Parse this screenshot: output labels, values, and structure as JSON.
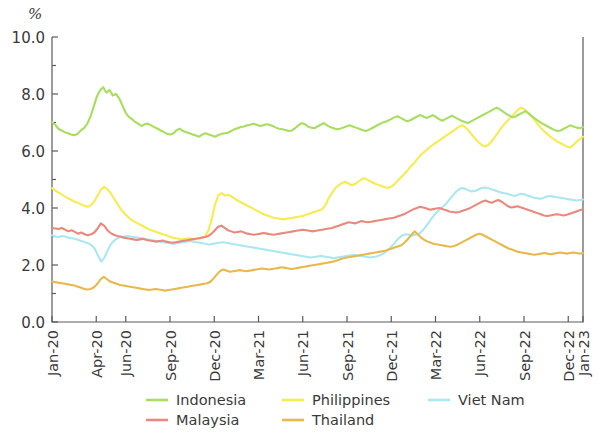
{
  "chart_data": {
    "type": "line",
    "title": "",
    "subtitle": "",
    "xlabel": "",
    "ylabel": "%",
    "unit_label": "%",
    "ylim": [
      0.0,
      10.0
    ],
    "ytick_labels": [
      "0.0",
      "2.0",
      "4.0",
      "6.0",
      "8.0",
      "10.0"
    ],
    "ytick_values": [
      0.0,
      2.0,
      4.0,
      6.0,
      8.0,
      10.0
    ],
    "yminor_values": [
      1.0,
      3.0,
      5.0,
      7.0,
      9.0
    ],
    "grid": false,
    "legend_position": "bottom",
    "x_tick_labels": [
      "Jan-20",
      "Apr-20",
      "Jun-20",
      "Sep-20",
      "Dec-20",
      "Mar-21",
      "Jun-21",
      "Sep-21",
      "Dec-21",
      "Mar-22",
      "Jun-22",
      "Sep-22",
      "Dec-22",
      "Jan-23"
    ],
    "x_tick_months": [
      0,
      3,
      5,
      8,
      11,
      14,
      17,
      20,
      23,
      26,
      29,
      32,
      35,
      36
    ],
    "x_range_months": [
      0,
      36
    ],
    "series": [
      {
        "name": "Indonesia",
        "color": "#a9dd5f",
        "values": [
          7.02,
          6.92,
          6.78,
          6.72,
          6.66,
          6.62,
          6.58,
          6.55,
          6.6,
          6.72,
          6.8,
          6.95,
          7.2,
          7.55,
          7.9,
          8.12,
          8.24,
          8.05,
          8.14,
          7.95,
          8.0,
          7.85,
          7.6,
          7.35,
          7.2,
          7.12,
          7.02,
          6.95,
          6.88,
          6.94,
          6.96,
          6.9,
          6.84,
          6.78,
          6.72,
          6.66,
          6.6,
          6.58,
          6.62,
          6.74,
          6.78,
          6.7,
          6.66,
          6.62,
          6.58,
          6.54,
          6.5,
          6.58,
          6.62,
          6.58,
          6.54,
          6.5,
          6.56,
          6.6,
          6.62,
          6.64,
          6.7,
          6.76,
          6.8,
          6.84,
          6.86,
          6.9,
          6.92,
          6.96,
          6.92,
          6.88,
          6.9,
          6.94,
          6.92,
          6.88,
          6.82,
          6.78,
          6.76,
          6.74,
          6.7,
          6.72,
          6.8,
          6.9,
          6.98,
          6.94,
          6.86,
          6.82,
          6.8,
          6.86,
          6.92,
          6.98,
          6.9,
          6.84,
          6.8,
          6.76,
          6.78,
          6.82,
          6.86,
          6.9,
          6.86,
          6.82,
          6.78,
          6.74,
          6.7,
          6.74,
          6.8,
          6.86,
          6.92,
          6.98,
          7.02,
          7.06,
          7.12,
          7.18,
          7.22,
          7.16,
          7.1,
          7.04,
          7.08,
          7.14,
          7.2,
          7.26,
          7.22,
          7.16,
          7.2,
          7.26,
          7.2,
          7.12,
          7.06,
          7.12,
          7.18,
          7.24,
          7.18,
          7.12,
          7.06,
          7.02,
          6.98,
          7.04,
          7.1,
          7.16,
          7.22,
          7.28,
          7.34,
          7.4,
          7.46,
          7.52,
          7.46,
          7.38,
          7.3,
          7.24,
          7.18,
          7.22,
          7.28,
          7.34,
          7.4,
          7.32,
          7.22,
          7.14,
          7.06,
          6.98,
          6.92,
          6.86,
          6.8,
          6.74,
          6.7,
          6.72,
          6.78,
          6.84,
          6.9,
          6.86,
          6.82,
          6.8,
          6.84
        ]
      },
      {
        "name": "Malaysia",
        "color": "#e9887c",
        "values": [
          3.3,
          3.28,
          3.26,
          3.3,
          3.24,
          3.18,
          3.22,
          3.16,
          3.1,
          3.14,
          3.08,
          3.04,
          3.08,
          3.14,
          3.28,
          3.46,
          3.38,
          3.22,
          3.12,
          3.06,
          3.02,
          3.0,
          2.96,
          2.94,
          2.92,
          2.9,
          2.88,
          2.9,
          2.92,
          2.88,
          2.86,
          2.84,
          2.82,
          2.84,
          2.86,
          2.82,
          2.8,
          2.78,
          2.8,
          2.82,
          2.84,
          2.86,
          2.88,
          2.9,
          2.92,
          2.94,
          2.96,
          2.98,
          3.02,
          3.1,
          3.22,
          3.34,
          3.38,
          3.3,
          3.22,
          3.18,
          3.14,
          3.16,
          3.18,
          3.14,
          3.1,
          3.08,
          3.06,
          3.08,
          3.1,
          3.12,
          3.1,
          3.08,
          3.06,
          3.08,
          3.1,
          3.12,
          3.14,
          3.16,
          3.18,
          3.2,
          3.22,
          3.24,
          3.22,
          3.2,
          3.18,
          3.2,
          3.22,
          3.24,
          3.26,
          3.28,
          3.3,
          3.34,
          3.38,
          3.42,
          3.46,
          3.5,
          3.48,
          3.46,
          3.5,
          3.54,
          3.52,
          3.5,
          3.52,
          3.54,
          3.56,
          3.58,
          3.6,
          3.62,
          3.64,
          3.66,
          3.7,
          3.74,
          3.78,
          3.84,
          3.9,
          3.96,
          4.0,
          4.04,
          4.02,
          3.98,
          3.94,
          3.96,
          3.98,
          4.0,
          3.96,
          3.92,
          3.88,
          3.86,
          3.84,
          3.86,
          3.9,
          3.94,
          3.98,
          4.04,
          4.1,
          4.16,
          4.22,
          4.26,
          4.22,
          4.18,
          4.24,
          4.28,
          4.22,
          4.14,
          4.06,
          4.02,
          4.04,
          4.06,
          4.02,
          3.98,
          3.94,
          3.9,
          3.86,
          3.82,
          3.78,
          3.74,
          3.72,
          3.74,
          3.76,
          3.78,
          3.76,
          3.74,
          3.76,
          3.8,
          3.84,
          3.88,
          3.92,
          3.96
        ]
      },
      {
        "name": "Philippines",
        "color": "#f7ec4f",
        "values": [
          4.7,
          4.62,
          4.54,
          4.48,
          4.4,
          4.34,
          4.28,
          4.22,
          4.18,
          4.12,
          4.08,
          4.04,
          4.1,
          4.24,
          4.44,
          4.64,
          4.74,
          4.66,
          4.52,
          4.34,
          4.16,
          3.98,
          3.84,
          3.72,
          3.62,
          3.54,
          3.48,
          3.42,
          3.36,
          3.3,
          3.24,
          3.2,
          3.16,
          3.12,
          3.08,
          3.04,
          3.0,
          2.96,
          2.94,
          2.92,
          2.9,
          2.92,
          2.94,
          2.92,
          2.9,
          2.92,
          2.96,
          3.0,
          3.2,
          3.6,
          4.1,
          4.44,
          4.52,
          4.44,
          4.46,
          4.42,
          4.34,
          4.26,
          4.2,
          4.14,
          4.08,
          4.02,
          3.96,
          3.9,
          3.84,
          3.78,
          3.74,
          3.7,
          3.66,
          3.64,
          3.62,
          3.6,
          3.62,
          3.64,
          3.66,
          3.68,
          3.7,
          3.72,
          3.76,
          3.8,
          3.84,
          3.88,
          3.92,
          3.96,
          4.12,
          4.36,
          4.54,
          4.7,
          4.8,
          4.88,
          4.92,
          4.86,
          4.8,
          4.84,
          4.92,
          5.0,
          5.04,
          4.98,
          4.92,
          4.86,
          4.82,
          4.78,
          4.74,
          4.7,
          4.74,
          4.82,
          4.94,
          5.06,
          5.18,
          5.3,
          5.44,
          5.56,
          5.7,
          5.84,
          5.94,
          6.04,
          6.14,
          6.22,
          6.3,
          6.38,
          6.46,
          6.54,
          6.62,
          6.7,
          6.78,
          6.86,
          6.9,
          6.82,
          6.7,
          6.56,
          6.42,
          6.3,
          6.2,
          6.16,
          6.22,
          6.34,
          6.5,
          6.66,
          6.82,
          6.96,
          7.08,
          7.2,
          7.32,
          7.44,
          7.52,
          7.46,
          7.36,
          7.24,
          7.1,
          6.96,
          6.82,
          6.7,
          6.6,
          6.5,
          6.42,
          6.34,
          6.28,
          6.22,
          6.16,
          6.12,
          6.2,
          6.32,
          6.42,
          6.5
        ]
      },
      {
        "name": "Thailand",
        "color": "#e9b84d"
      },
      {
        "name": "Viet Nam",
        "color": "#abe7f1"
      }
    ],
    "series_thailand_values": [
      1.42,
      1.4,
      1.38,
      1.36,
      1.34,
      1.32,
      1.3,
      1.28,
      1.24,
      1.2,
      1.16,
      1.14,
      1.16,
      1.22,
      1.34,
      1.5,
      1.58,
      1.5,
      1.42,
      1.38,
      1.34,
      1.3,
      1.28,
      1.26,
      1.24,
      1.22,
      1.2,
      1.18,
      1.16,
      1.14,
      1.12,
      1.14,
      1.16,
      1.14,
      1.12,
      1.1,
      1.12,
      1.14,
      1.16,
      1.18,
      1.2,
      1.22,
      1.24,
      1.26,
      1.28,
      1.3,
      1.32,
      1.34,
      1.36,
      1.42,
      1.54,
      1.68,
      1.8,
      1.84,
      1.8,
      1.76,
      1.78,
      1.8,
      1.82,
      1.8,
      1.78,
      1.8,
      1.82,
      1.84,
      1.86,
      1.88,
      1.86,
      1.84,
      1.86,
      1.88,
      1.9,
      1.92,
      1.9,
      1.88,
      1.86,
      1.88,
      1.9,
      1.92,
      1.94,
      1.96,
      1.98,
      2.0,
      2.02,
      2.04,
      2.06,
      2.08,
      2.1,
      2.12,
      2.16,
      2.2,
      2.24,
      2.26,
      2.28,
      2.3,
      2.32,
      2.34,
      2.36,
      2.38,
      2.4,
      2.42,
      2.44,
      2.46,
      2.48,
      2.5,
      2.54,
      2.58,
      2.62,
      2.66,
      2.7,
      2.8,
      2.92,
      3.06,
      3.18,
      3.08,
      2.96,
      2.88,
      2.82,
      2.78,
      2.74,
      2.72,
      2.7,
      2.68,
      2.66,
      2.64,
      2.66,
      2.7,
      2.76,
      2.82,
      2.88,
      2.94,
      3.0,
      3.06,
      3.1,
      3.06,
      3.0,
      2.94,
      2.88,
      2.82,
      2.76,
      2.7,
      2.64,
      2.58,
      2.54,
      2.5,
      2.46,
      2.44,
      2.42,
      2.4,
      2.38,
      2.36,
      2.38,
      2.4,
      2.42,
      2.4,
      2.38,
      2.4,
      2.42,
      2.44,
      2.42,
      2.4,
      2.42,
      2.44,
      2.42,
      2.4,
      2.42
    ],
    "series_vietnam_values": [
      3.04,
      3.0,
      2.98,
      3.02,
      3.0,
      2.96,
      2.94,
      2.92,
      2.88,
      2.84,
      2.8,
      2.76,
      2.7,
      2.58,
      2.34,
      2.12,
      2.26,
      2.52,
      2.74,
      2.86,
      2.94,
      2.98,
      3.0,
      3.02,
      3.0,
      2.98,
      2.96,
      2.94,
      2.92,
      2.9,
      2.88,
      2.86,
      2.84,
      2.82,
      2.8,
      2.78,
      2.76,
      2.74,
      2.76,
      2.78,
      2.8,
      2.82,
      2.84,
      2.82,
      2.8,
      2.78,
      2.76,
      2.74,
      2.72,
      2.74,
      2.76,
      2.78,
      2.8,
      2.78,
      2.76,
      2.74,
      2.72,
      2.7,
      2.68,
      2.66,
      2.64,
      2.62,
      2.6,
      2.58,
      2.56,
      2.54,
      2.52,
      2.5,
      2.48,
      2.46,
      2.44,
      2.42,
      2.4,
      2.38,
      2.36,
      2.34,
      2.32,
      2.3,
      2.28,
      2.26,
      2.28,
      2.3,
      2.32,
      2.3,
      2.28,
      2.26,
      2.24,
      2.26,
      2.28,
      2.3,
      2.32,
      2.34,
      2.36,
      2.34,
      2.32,
      2.3,
      2.28,
      2.26,
      2.28,
      2.3,
      2.34,
      2.4,
      2.48,
      2.58,
      2.7,
      2.84,
      2.96,
      3.04,
      3.08,
      3.06,
      3.04,
      3.06,
      3.1,
      3.2,
      3.34,
      3.5,
      3.66,
      3.8,
      3.92,
      4.02,
      4.12,
      4.26,
      4.4,
      4.54,
      4.64,
      4.7,
      4.68,
      4.62,
      4.58,
      4.6,
      4.64,
      4.7,
      4.72,
      4.7,
      4.66,
      4.62,
      4.58,
      4.54,
      4.52,
      4.5,
      4.46,
      4.42,
      4.46,
      4.5,
      4.48,
      4.44,
      4.4,
      4.36,
      4.34,
      4.32,
      4.36,
      4.4,
      4.42,
      4.4,
      4.38,
      4.36,
      4.34,
      4.32,
      4.3,
      4.28,
      4.26,
      4.28,
      4.3
    ]
  },
  "legend": {
    "entries": [
      {
        "label": "Indonesia",
        "color": "#a9dd5f",
        "row": 0,
        "col": 0
      },
      {
        "label": "Philippines",
        "color": "#f7ec4f",
        "row": 0,
        "col": 1
      },
      {
        "label": "Viet Nam",
        "color": "#abe7f1",
        "row": 0,
        "col": 2
      },
      {
        "label": "Malaysia",
        "color": "#e9887c",
        "row": 1,
        "col": 0
      },
      {
        "label": "Thailand",
        "color": "#e9b84d",
        "row": 1,
        "col": 1
      }
    ]
  }
}
